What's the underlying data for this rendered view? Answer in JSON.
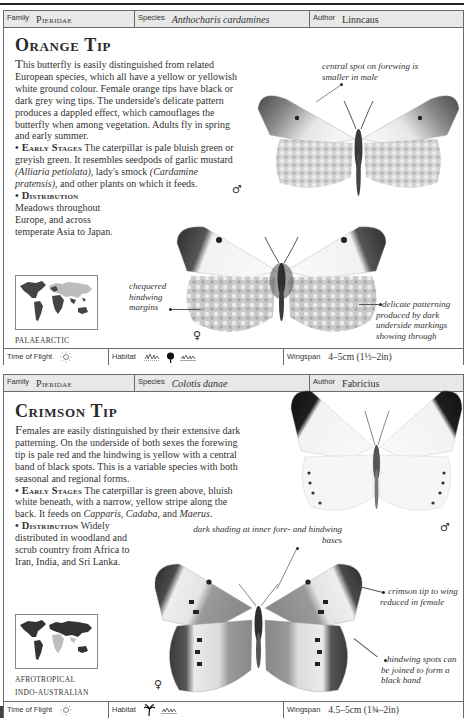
{
  "entries": [
    {
      "header": {
        "family_label": "Family",
        "family": "Pieridae",
        "species_label": "Species",
        "species": "Anthocharis cardamines",
        "author_label": "Author",
        "author": "Linncaus"
      },
      "title": "Orange Tip",
      "intro_dropcap": "T",
      "intro": "his butterfly is easily distinguished from related European species, which all have a yellow or yellowish white ground colour. Female orange tips have black or dark grey wing tips. The underside's delicate pattern produces a dappled effect, which camouflages the butterfly when among vegetation. Adults fly in spring and early summer.",
      "early_stages_heading": "• Early Stages",
      "early_stages_a": " The caterpillar is pale bluish green or greyish green. It resembles seedpods of garlic mustard ",
      "early_stages_it1": "(Alliaria petiolata)",
      "early_stages_b": ", lady's smock ",
      "early_stages_it2": "(Cardamine pratensis)",
      "early_stages_c": ", and other plants on which it feeds.",
      "distribution_heading": "• Distribution",
      "distribution": "Meadows throughout Europe, and across temperate Asia to Japan.",
      "map_icon": "world-map-icon",
      "region_lines": [
        "PALAEARCTIC"
      ],
      "captions": {
        "male_spot": "central spot on forewing is smaller in male",
        "chequered": "chequered hindwing margins",
        "delicate": "delicate patterning produced by dark underside markings showing through"
      },
      "sex_symbols": {
        "male": "♂",
        "female": "♀"
      },
      "footer": {
        "time_label": "Time of Flight",
        "time_icon": "sun-icon",
        "habitat_label": "Habitat",
        "habitat_icons": [
          "meadow-icon",
          "tree-icon",
          "meadow-icon"
        ],
        "wingspan_label": "Wingspan",
        "wingspan": "4–5cm (1½–2in)"
      },
      "colors": {
        "wingtip": "#3a3a3a",
        "dapple": "#b8b8b8"
      }
    },
    {
      "header": {
        "family_label": "Family",
        "family": "Pieridae",
        "species_label": "Species",
        "species": "Colotis danae",
        "author_label": "Author",
        "author": "Fabricius"
      },
      "title": "Crimson Tip",
      "intro_dropcap": "F",
      "intro": "emales are easily distinguished by their extensive dark patterning. On the underside of both sexes the forewing tip is pale red and the hindwing is yellow with a central band of black spots. This is a variable species with both seasonal and regional forms.",
      "early_stages_heading": "• Early Stages",
      "early_stages_a": " The caterpillar is green above, bluish white beneath, with a narrow, yellow stripe along the back. It feeds on ",
      "early_stages_it1": "Capparis",
      "early_stages_b": ", ",
      "early_stages_it2": "Cadaba",
      "early_stages_c": ", and ",
      "early_stages_it3": "Maerus",
      "early_stages_d": ".",
      "distribution_heading": "• Distribution",
      "distribution": " Widely distributed in woodland and scrub country from Africa to Iran, India, and Sri Lanka.",
      "map_icon": "world-map-icon",
      "region_lines": [
        "AFROTROPICAL",
        "INDO-AUSTRALIAN"
      ],
      "captions": {
        "dark_shading": "dark shading at inner fore- and hindwing bases",
        "crimson": "crimson tip to wing reduced in female",
        "hindwing_spots": "hindwing spots can be joined to form a black band"
      },
      "sex_symbols": {
        "male": "♂",
        "female": "♀"
      },
      "footer": {
        "time_label": "Time of Flight",
        "time_icon": "sun-icon",
        "habitat_label": "Habitat",
        "habitat_icons": [
          "palm-tree-icon",
          "meadow-icon"
        ],
        "wingspan_label": "Wingspan",
        "wingspan": "4.5–5cm (1¾–2in)"
      },
      "colors": {
        "wingtip": "#1e1e1e",
        "shade": "#8c8c8c"
      }
    }
  ]
}
